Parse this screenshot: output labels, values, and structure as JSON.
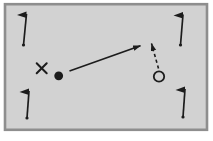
{
  "diagram": {
    "canvas": {
      "width": 213,
      "height": 141,
      "background": "#ffffff"
    },
    "field": {
      "id": "playing-field",
      "x": 5,
      "y": 4.2,
      "width": 202,
      "height": 125.6,
      "fill": "#d2d2d2",
      "stroke": "#8e8e8e",
      "stroke_width": 2.6
    },
    "ink": "#1c1c1c",
    "corner_flags": [
      {
        "id": "corner-flag-top-left",
        "base": [
          23.5,
          45
        ],
        "top": [
          26.5,
          14
        ]
      },
      {
        "id": "corner-flag-top-right",
        "base": [
          180.5,
          45
        ],
        "top": [
          183,
          14.5
        ]
      },
      {
        "id": "corner-flag-bottom-left",
        "base": [
          27,
          118
        ],
        "top": [
          29,
          91
        ]
      },
      {
        "id": "corner-flag-bottom-right",
        "base": [
          183,
          117
        ],
        "top": [
          185,
          89
        ]
      }
    ],
    "flag_style": {
      "pole_stroke_width": 1.7,
      "pennant_length": 9.5,
      "pennant_rise": 2.5,
      "pennant_drop": 4,
      "base_dot_radius": 1.6
    },
    "markers": {
      "attacker": {
        "id": "player-x-marker",
        "symbol": "X",
        "x": 41.7,
        "y": 68.3,
        "size": 10,
        "stroke_width": 2
      },
      "ball": {
        "id": "ball-dot",
        "x": 58.7,
        "y": 75.8,
        "radius": 4.4
      },
      "receiver": {
        "id": "player-o-marker",
        "symbol": "O",
        "x": 159,
        "y": 76.5,
        "radius": 5.2,
        "stroke_width": 1.8
      }
    },
    "arrows": [
      {
        "id": "pass-arrow",
        "line_style": "solid",
        "from": [
          69.5,
          71
        ],
        "to": [
          140.5,
          45.7
        ],
        "stroke_width": 1.7,
        "dash": ""
      },
      {
        "id": "run-arrow",
        "line_style": "dashed",
        "from": [
          158.5,
          68.5
        ],
        "to": [
          151.5,
          43.5
        ],
        "stroke_width": 1.6,
        "dash": "3.2,2.8"
      }
    ]
  }
}
